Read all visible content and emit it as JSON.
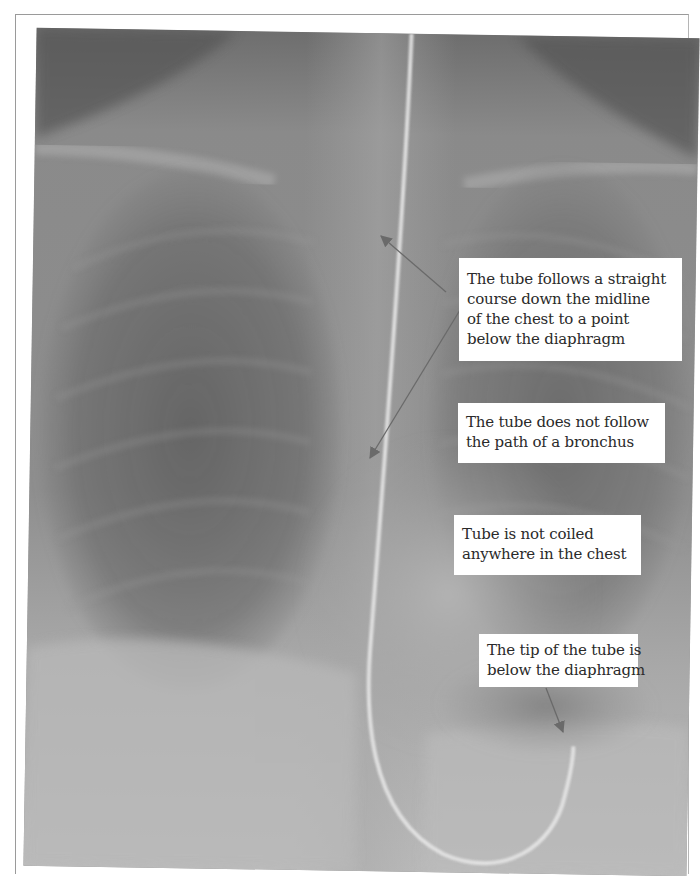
{
  "figure": {
    "colors": {
      "background": "#ffffff",
      "callout_bg": "#ffffff",
      "callout_text": "#2a2a2a",
      "arrow": "#6a6a6a",
      "tube": "#e4e4e4"
    }
  },
  "callouts": [
    {
      "id": "midline-course",
      "lines": [
        "The tube follows a straight",
        "course down the midline",
        "of the chest to a point",
        "below the diaphragm"
      ]
    },
    {
      "id": "not-bronchus",
      "lines": [
        "The tube does not follow",
        "the path of a bronchus"
      ]
    },
    {
      "id": "not-coiled",
      "lines": [
        "Tube is not coiled",
        "anywhere in the chest"
      ]
    },
    {
      "id": "tip-below-diaphragm",
      "lines": [
        "The tip of the tube is",
        "below the diaphragm"
      ]
    }
  ],
  "arrows": [
    {
      "from": [
        446,
        292
      ],
      "to": [
        381,
        236
      ],
      "target": "tube-upper"
    },
    {
      "from": [
        460,
        310
      ],
      "to": [
        370,
        458
      ],
      "target": "tube-lower"
    },
    {
      "from": [
        546,
        688
      ],
      "to": [
        563,
        732
      ],
      "target": "tube-tip"
    }
  ]
}
